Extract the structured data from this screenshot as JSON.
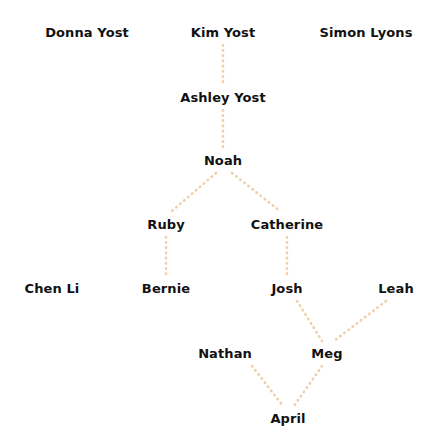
{
  "diagram": {
    "kind": "family-tree",
    "width": 439,
    "height": 448,
    "background_color": "#ffffff",
    "label_color": "#111111",
    "edge_color": "#f0d0a8",
    "edge_style": "dotted"
  },
  "nodes": [
    {
      "id": "donna_yost",
      "label": "Donna Yost",
      "x": 87,
      "y": 32,
      "row": 1
    },
    {
      "id": "kim_yost",
      "label": "Kim Yost",
      "x": 223,
      "y": 32,
      "row": 1
    },
    {
      "id": "simon_lyons",
      "label": "Simon Lyons",
      "x": 366,
      "y": 32,
      "row": 1
    },
    {
      "id": "ashley_yost",
      "label": "Ashley Yost",
      "x": 223,
      "y": 97,
      "row": 2
    },
    {
      "id": "noah",
      "label": "Noah",
      "x": 223,
      "y": 160,
      "row": 3
    },
    {
      "id": "ruby",
      "label": "Ruby",
      "x": 166,
      "y": 224,
      "row": 4
    },
    {
      "id": "catherine",
      "label": "Catherine",
      "x": 287,
      "y": 224,
      "row": 4
    },
    {
      "id": "chen_li",
      "label": "Chen Li",
      "x": 52,
      "y": 288,
      "row": 5
    },
    {
      "id": "bernie",
      "label": "Bernie",
      "x": 166,
      "y": 288,
      "row": 5
    },
    {
      "id": "josh",
      "label": "Josh",
      "x": 287,
      "y": 288,
      "row": 5
    },
    {
      "id": "leah",
      "label": "Leah",
      "x": 396,
      "y": 288,
      "row": 5
    },
    {
      "id": "nathan",
      "label": "Nathan",
      "x": 225,
      "y": 353,
      "row": 6
    },
    {
      "id": "meg",
      "label": "Meg",
      "x": 327,
      "y": 353,
      "row": 6
    },
    {
      "id": "april",
      "label": "April",
      "x": 288,
      "y": 418,
      "row": 7
    }
  ],
  "edges": [
    {
      "id": "kim-to-ashley",
      "from": "kim_yost",
      "to": "ashley_yost",
      "x1": 223,
      "y1": 45,
      "x2": 223,
      "y2": 84
    },
    {
      "id": "ashley-to-noah",
      "from": "ashley_yost",
      "to": "noah",
      "x1": 223,
      "y1": 110,
      "x2": 223,
      "y2": 148
    },
    {
      "id": "noah-to-ruby",
      "from": "noah",
      "to": "ruby",
      "x1": 216,
      "y1": 173,
      "x2": 172,
      "y2": 211
    },
    {
      "id": "noah-to-catherine",
      "from": "noah",
      "to": "catherine",
      "x1": 232,
      "y1": 173,
      "x2": 280,
      "y2": 211
    },
    {
      "id": "ruby-to-bernie",
      "from": "ruby",
      "to": "bernie",
      "x1": 166,
      "y1": 237,
      "x2": 166,
      "y2": 276
    },
    {
      "id": "catherine-to-josh",
      "from": "catherine",
      "to": "josh",
      "x1": 287,
      "y1": 237,
      "x2": 287,
      "y2": 276
    },
    {
      "id": "josh-to-meg",
      "from": "josh",
      "to": "meg",
      "x1": 297,
      "y1": 301,
      "x2": 322,
      "y2": 341
    },
    {
      "id": "leah-to-meg",
      "from": "leah",
      "to": "meg",
      "x1": 386,
      "y1": 301,
      "x2": 334,
      "y2": 341
    },
    {
      "id": "nathan-to-april",
      "from": "nathan",
      "to": "april",
      "x1": 252,
      "y1": 366,
      "x2": 283,
      "y2": 406
    },
    {
      "id": "meg-to-april",
      "from": "meg",
      "to": "april",
      "x1": 322,
      "y1": 366,
      "x2": 294,
      "y2": 406
    }
  ]
}
